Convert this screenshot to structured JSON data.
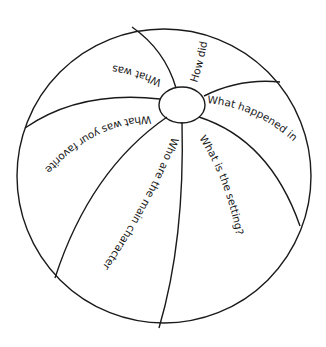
{
  "diagram": {
    "type": "beach-ball-worksheet",
    "colors": {
      "stroke": "#1a1a1a",
      "background": "#ffffff"
    },
    "panels": [
      {
        "id": "top-left",
        "prompt": "What was"
      },
      {
        "id": "top",
        "prompt": "How did"
      },
      {
        "id": "right",
        "prompt": "What happened in"
      },
      {
        "id": "left",
        "prompt": "What was your favorite"
      },
      {
        "id": "bottom-center",
        "prompt": "Who are the main characters?"
      },
      {
        "id": "bottom-right",
        "prompt": "What is the setting?"
      }
    ]
  }
}
